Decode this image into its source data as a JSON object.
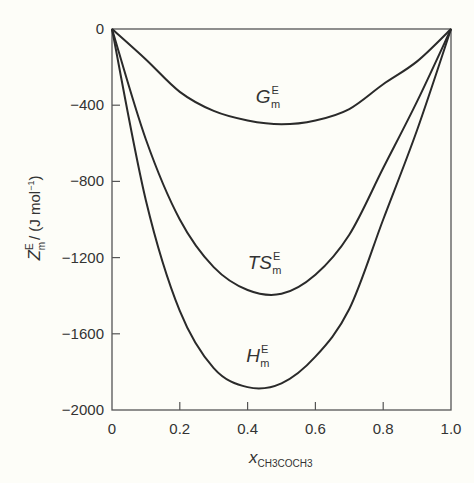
{
  "chart_data": {
    "type": "line",
    "title": "",
    "xlabel": "x_CH3COCH3",
    "xlabel_main": "x",
    "xlabel_sub": "CH3COCH3",
    "ylabel": "Z_m^E / (J mol^-1)",
    "ylabel_main": "Z",
    "ylabel_sup": "E",
    "ylabel_sub": "m",
    "ylabel_unit": "/ (J mol",
    "ylabel_unit_sup": "−1",
    "ylabel_unit_close": ")",
    "xlim": [
      0,
      1.0
    ],
    "ylim": [
      -2000,
      0
    ],
    "grid": false,
    "legend": "none (inline curve labels)",
    "x_ticks": [
      "0",
      "0.2",
      "0.4",
      "0.6",
      "0.8",
      "1.0"
    ],
    "y_ticks": [
      "0",
      "−400",
      "−800",
      "−1200",
      "−1600",
      "−2000"
    ],
    "x": [
      0,
      0.1,
      0.2,
      0.3,
      0.4,
      0.5,
      0.6,
      0.7,
      0.8,
      0.9,
      1.0
    ],
    "series": [
      {
        "name": "G_m^E",
        "label_main": "G",
        "label_sup": "E",
        "label_sub": "m",
        "values": [
          0,
          -160,
          -330,
          -430,
          -480,
          -500,
          -480,
          -420,
          -290,
          -170,
          0
        ]
      },
      {
        "name": "TS_m^E",
        "label_main": "TS",
        "label_sup": "E",
        "label_sub": "m",
        "values": [
          0,
          -580,
          -1000,
          -1250,
          -1370,
          -1390,
          -1290,
          -1080,
          -730,
          -380,
          0
        ]
      },
      {
        "name": "H_m^E",
        "label_main": "H",
        "label_sup": "E",
        "label_sub": "m",
        "values": [
          0,
          -900,
          -1480,
          -1780,
          -1880,
          -1860,
          -1720,
          -1470,
          -1000,
          -530,
          0
        ]
      }
    ],
    "annotations": [
      {
        "text": "G_m^E",
        "x": 0.46,
        "y": -390
      },
      {
        "text": "TS_m^E",
        "x": 0.45,
        "y": -1260
      },
      {
        "text": "H_m^E",
        "x": 0.43,
        "y": -1750
      }
    ]
  },
  "colors": {
    "background": "#fdfdf8",
    "line": "#2a2a2a",
    "axis": "#555555",
    "text": "#333333"
  }
}
